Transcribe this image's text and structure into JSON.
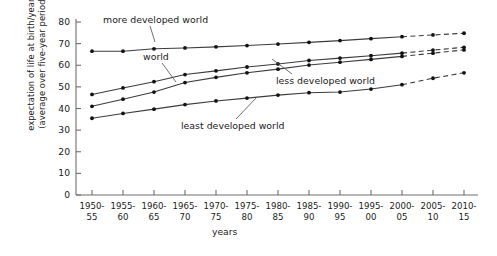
{
  "chart_data": {
    "type": "line",
    "title": "",
    "xlabel": "years",
    "ylabel": "expectation of life at birth/years (average over five-year period)",
    "ylabel_line1": "expectation of life at birth/years",
    "ylabel_line2": "(average over five-year period)",
    "ylim": [
      0,
      80
    ],
    "yticks": [
      0,
      10,
      20,
      30,
      40,
      50,
      60,
      70,
      80
    ],
    "grid": false,
    "legend_position": "inline-annotations",
    "categories": [
      "1950-55",
      "1955-60",
      "1960-65",
      "1965-70",
      "1970-75",
      "1975-80",
      "1980-85",
      "1985-90",
      "1990-95",
      "1995-00",
      "2000-05",
      "2005-10",
      "2010-15"
    ],
    "xtick_labels_top": [
      "1950-",
      "1955-",
      "1960-",
      "1965-",
      "1970-",
      "1975-",
      "1980-",
      "1985-",
      "1990-",
      "1995-",
      "2000-",
      "2005-",
      "2010-"
    ],
    "xtick_labels_bottom": [
      "55",
      "60",
      "65",
      "70",
      "75",
      "80",
      "85",
      "90",
      "95",
      "00",
      "05",
      "10",
      "15"
    ],
    "projection_starts_at_index": 10,
    "series": [
      {
        "name": "more developed world",
        "label": "more developed world",
        "color": "#3c3c3c",
        "values": [
          66.5,
          66.5,
          67.6,
          68.0,
          68.5,
          69.1,
          69.8,
          70.6,
          71.4,
          72.3,
          73.2,
          74.0,
          74.8
        ]
      },
      {
        "name": "world",
        "label": "world",
        "color": "#3c3c3c",
        "values": [
          46.5,
          49.5,
          52.4,
          55.7,
          57.4,
          59.2,
          60.6,
          62.2,
          63.3,
          64.4,
          65.6,
          67.0,
          68.3
        ]
      },
      {
        "name": "less developed world",
        "label": "less developed world",
        "color": "#3c3c3c",
        "values": [
          41.0,
          44.3,
          47.6,
          52.0,
          54.4,
          56.5,
          58.2,
          60.1,
          61.4,
          62.7,
          64.1,
          65.6,
          67.1
        ]
      },
      {
        "name": "least developed world",
        "label": "least developed world",
        "color": "#3c3c3c",
        "values": [
          35.5,
          37.7,
          39.7,
          41.8,
          43.5,
          44.8,
          46.2,
          47.3,
          47.6,
          49.0,
          51.0,
          54.0,
          56.5
        ]
      }
    ],
    "annotations": [
      {
        "text": "more developed world",
        "series": "more developed world"
      },
      {
        "text": "world",
        "series": "world"
      },
      {
        "text": "less developed world",
        "series": "less developed world"
      },
      {
        "text": "least developed world",
        "series": "least developed world"
      }
    ]
  }
}
